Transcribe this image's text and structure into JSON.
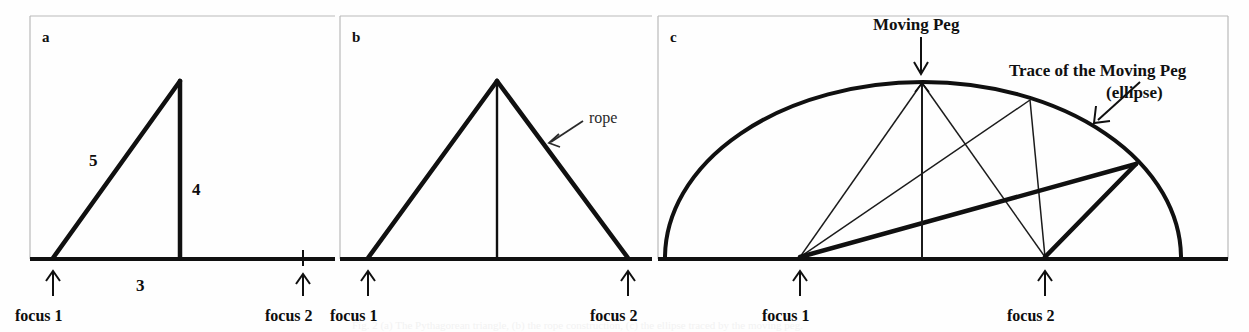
{
  "figure": {
    "width": 1249,
    "height": 332,
    "background_color": "#fefefe",
    "stroke_color": "#111111",
    "border_color": "#b9b9b9",
    "ghost_caption": "Fig. 2 (a) The Pythagorean triangle, (b) the rope construction, (c) the ellipse traced by the moving peg."
  },
  "panels": [
    {
      "id": "a",
      "letter": "a",
      "caption_labels": {
        "focus1": "focus 1",
        "focus2": "focus 2"
      },
      "side_labels": {
        "hypotenuse": "5",
        "vertical": "4",
        "base": "3"
      }
    },
    {
      "id": "b",
      "letter": "b",
      "caption_labels": {
        "focus1": "focus 1",
        "focus2": "focus 2"
      },
      "callouts": {
        "rope": "rope"
      }
    },
    {
      "id": "c",
      "letter": "c",
      "caption_labels": {
        "focus1": "focus 1",
        "focus2": "focus 2"
      },
      "callouts": {
        "moving_peg": "Moving Peg",
        "trace_line1": "Trace of the Moving Peg",
        "trace_line2": "(ellipse)"
      }
    }
  ]
}
